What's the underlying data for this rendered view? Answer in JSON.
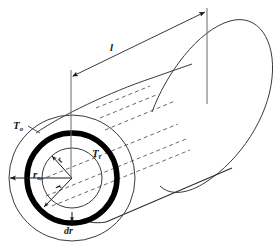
{
  "figure": {
    "type": "engineering-line-diagram",
    "width": 279,
    "height": 245,
    "background_color": "#ffffff",
    "line_color": "#1a1a1a",
    "thick_ring_color": "#000000",
    "dashed_color": "#555555"
  },
  "labels": {
    "outer_temperature": "T",
    "outer_temperature_sub": "o",
    "inner_temperature": "T",
    "inner_temperature_sub": "i",
    "outer_radius": "r",
    "outer_radius_sub": "o",
    "radius_upper": "r",
    "radius_lower": "r",
    "differential_thickness": "dr",
    "length": "l"
  },
  "geometry": {
    "cross_section_center": {
      "x": 72,
      "y": 178
    },
    "outer_circle_radius": 63,
    "thick_ring_radius": 45,
    "thick_ring_stroke": 5,
    "inner_circle_radius": 30,
    "ellipse_ry_ratio": 1.0,
    "axis_direction_deg": -32,
    "cylinder_length_px": 185,
    "far_cap_center": {
      "x": 228,
      "y": 80
    },
    "far_cap_rx": 44,
    "far_cap_ry": 62
  },
  "dimension_line": {
    "label": "l",
    "left_end": {
      "x": 71,
      "y": 75
    },
    "right_end": {
      "x": 207,
      "y": 12
    },
    "arrowheads": "both",
    "extension_lines": [
      {
        "x": 71,
        "y_top": 70,
        "y_bottom": 180
      },
      {
        "x": 207,
        "y_top": 8,
        "y_bottom": 105
      }
    ]
  },
  "hidden_edges": {
    "style": "dashed",
    "count": 6,
    "description": "dashed generator lines showing hidden bore of the pipe running along the axis"
  }
}
